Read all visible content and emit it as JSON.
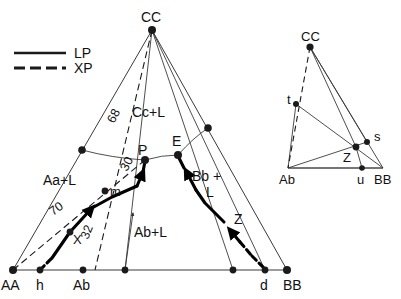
{
  "figure": {
    "background": "#ffffff",
    "line_color": "#333333",
    "bold_color": "#000000",
    "dot_color": "#1a1a1a"
  },
  "legend": {
    "items": [
      {
        "label": "LP",
        "style": "solid",
        "name": "legend-lp"
      },
      {
        "label": "XP",
        "style": "dashed",
        "name": "legend-xp"
      }
    ]
  },
  "main_diagram": {
    "vertices": [
      {
        "id": "CC",
        "label": "CC",
        "x": 152,
        "y": 30
      },
      {
        "id": "AA",
        "label": "AA",
        "x": 13,
        "y": 270
      },
      {
        "id": "BB",
        "label": "BB",
        "x": 287,
        "y": 270
      }
    ],
    "base_points": [
      {
        "id": "h",
        "label": "h",
        "x": 40,
        "y": 270
      },
      {
        "id": "Ab",
        "label": "Ab",
        "x": 83,
        "y": 270
      },
      {
        "id": "b1",
        "label": "",
        "x": 125,
        "y": 270
      },
      {
        "id": "b2",
        "label": "",
        "x": 233,
        "y": 270
      },
      {
        "id": "d",
        "label": "d",
        "x": 265,
        "y": 270
      }
    ],
    "invariant_points": [
      {
        "id": "P",
        "label": "P",
        "x": 145,
        "y": 160
      },
      {
        "id": "E",
        "label": "E",
        "x": 178,
        "y": 155
      },
      {
        "id": "m",
        "label": "m",
        "x": 105,
        "y": 191
      },
      {
        "id": "X",
        "label": "X",
        "x": 70,
        "y": 232
      },
      {
        "id": "Z",
        "label": "Z",
        "x": 232,
        "y": 229
      }
    ],
    "boundary_dots": [
      {
        "id": "left-cotectic-end",
        "x": 82,
        "y": 150
      },
      {
        "id": "right-cotectic-end",
        "x": 208,
        "y": 128
      }
    ],
    "field_labels": [
      {
        "id": "cc-field",
        "text": "Cc+L",
        "x": 150,
        "y": 112
      },
      {
        "id": "aa-field",
        "text": "Aa+L",
        "x": 62,
        "y": 180
      },
      {
        "id": "ab-field",
        "text": "Ab+L",
        "x": 150,
        "y": 232
      },
      {
        "id": "bb-field-1",
        "text": "Bb +",
        "x": 200,
        "y": 176
      },
      {
        "id": "bb-field-2",
        "text": "L",
        "x": 212,
        "y": 192
      },
      {
        "id": "z-path",
        "text": "Z",
        "x": 240,
        "y": 218
      }
    ],
    "tie_line_numbers": [
      {
        "id": "num-68",
        "text": "68",
        "x": 114,
        "y": 124,
        "rotate": -62
      },
      {
        "id": "num-30",
        "text": "30",
        "x": 127,
        "y": 172,
        "rotate": -62
      },
      {
        "id": "num-70",
        "text": "70",
        "x": 59,
        "y": 214,
        "rotate": -34
      },
      {
        "id": "num-32",
        "text": "32",
        "x": 89,
        "y": 238,
        "rotate": -68
      }
    ]
  },
  "inset_diagram": {
    "vertices": [
      {
        "id": "CC",
        "label": "CC",
        "x": 310,
        "y": 47
      },
      {
        "id": "Ab",
        "label": "Ab",
        "x": 288,
        "y": 168
      },
      {
        "id": "BB",
        "label": "BB",
        "x": 383,
        "y": 168
      }
    ],
    "points": [
      {
        "id": "t",
        "label": "t",
        "x": 296,
        "y": 104
      },
      {
        "id": "s",
        "label": "s",
        "x": 367,
        "y": 142
      },
      {
        "id": "u",
        "label": "u",
        "x": 362,
        "y": 168
      },
      {
        "id": "Z",
        "label": "Z",
        "x": 356,
        "y": 147
      }
    ]
  }
}
